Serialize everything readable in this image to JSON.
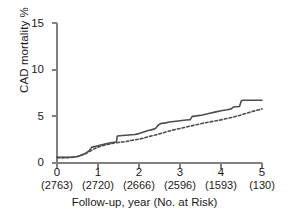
{
  "chart_data": {
    "type": "line",
    "title": "",
    "xlabel": "Follow-up, year (No. at Risk)",
    "ylabel": "CAD mortality %",
    "xlim": [
      0,
      5
    ],
    "ylim": [
      0,
      15
    ],
    "xticks": [
      0,
      1,
      2,
      3,
      4,
      5
    ],
    "xticklabels": [
      "0",
      "1",
      "2",
      "3",
      "4",
      "5"
    ],
    "yticks": [
      0,
      5,
      10,
      15
    ],
    "yticklabels": [
      "0",
      "5",
      "10",
      "15"
    ],
    "grid": false,
    "legend": "none",
    "at_risk_label": "No. at Risk",
    "at_risk": [
      "(2763)",
      "(2720)",
      "(2666)",
      "(2596)",
      "(1593)",
      "(130)"
    ],
    "series": [
      {
        "name": "solid-curve",
        "style": "solid",
        "color": "#4d4d4d",
        "x": [
          0.0,
          0.2,
          0.35,
          0.5,
          0.6,
          0.7,
          0.78,
          0.85,
          0.95,
          1.05,
          1.15,
          1.25,
          1.35,
          1.45,
          1.47,
          1.6,
          1.75,
          1.9,
          2.0,
          2.1,
          2.2,
          2.3,
          2.4,
          2.48,
          2.55,
          2.65,
          2.75,
          2.85,
          2.95,
          3.05,
          3.15,
          3.25,
          3.3,
          3.4,
          3.55,
          3.7,
          3.85,
          4.0,
          4.15,
          4.25,
          4.3,
          4.45,
          4.5,
          4.55,
          4.75,
          5.0
        ],
        "y": [
          0.6,
          0.6,
          0.62,
          0.7,
          0.85,
          1.05,
          1.3,
          1.7,
          1.8,
          1.9,
          2.0,
          2.1,
          2.2,
          2.25,
          2.9,
          2.95,
          3.0,
          3.05,
          3.15,
          3.3,
          3.45,
          3.55,
          3.7,
          4.1,
          4.25,
          4.3,
          4.4,
          4.45,
          4.5,
          4.55,
          4.6,
          4.65,
          5.0,
          5.05,
          5.15,
          5.3,
          5.45,
          5.6,
          5.7,
          5.8,
          6.0,
          6.05,
          6.7,
          6.72,
          6.72,
          6.72
        ]
      },
      {
        "name": "dashed-curve",
        "style": "dashed",
        "color": "#4d4d4d",
        "x": [
          0.0,
          0.25,
          0.4,
          0.55,
          0.7,
          0.8,
          0.9,
          1.0,
          1.1,
          1.2,
          1.3,
          1.4,
          1.5,
          1.6,
          1.7,
          1.8,
          1.9,
          2.0,
          2.1,
          2.2,
          2.3,
          2.4,
          2.5,
          2.6,
          2.7,
          2.8,
          2.9,
          3.0,
          3.1,
          3.25,
          3.4,
          3.55,
          3.7,
          3.85,
          4.0,
          4.15,
          4.3,
          4.45,
          4.6,
          4.75,
          4.9,
          5.0
        ],
        "y": [
          0.58,
          0.58,
          0.62,
          0.75,
          1.0,
          1.25,
          1.5,
          1.7,
          1.85,
          1.95,
          2.05,
          2.15,
          2.2,
          2.25,
          2.32,
          2.4,
          2.48,
          2.55,
          2.65,
          2.78,
          2.9,
          3.0,
          3.12,
          3.25,
          3.38,
          3.5,
          3.6,
          3.7,
          3.8,
          3.95,
          4.1,
          4.25,
          4.38,
          4.5,
          4.62,
          4.78,
          4.92,
          5.1,
          5.3,
          5.5,
          5.68,
          5.8
        ]
      }
    ]
  },
  "axis_colors": {
    "axis_line": "#808080",
    "tick": "#808080",
    "curve": "#4d4d4d"
  }
}
